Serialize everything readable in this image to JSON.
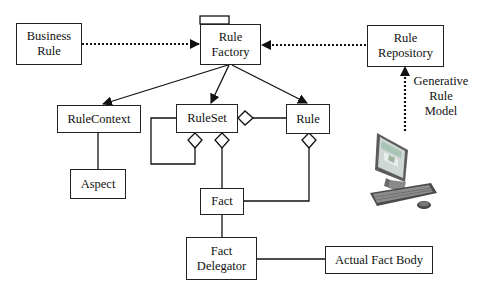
{
  "diagram": {
    "type": "uml-class-diagram",
    "nodes": {
      "business_rule": {
        "label": "Business\nRule"
      },
      "rule_factory": {
        "label": "Rule\nFactory"
      },
      "rule_repository": {
        "label": "Rule\nRepository"
      },
      "rule_context": {
        "label": "RuleContext"
      },
      "aspect": {
        "label": "Aspect"
      },
      "rule_set": {
        "label": "RuleSet"
      },
      "rule": {
        "label": "Rule"
      },
      "fact": {
        "label": "Fact"
      },
      "fact_delegator": {
        "label": "Fact\nDelegator"
      },
      "actual_fact_body": {
        "label": "Actual Fact Body"
      }
    },
    "annotations": {
      "generative_rule_model": "Generative\nRule\nModel"
    },
    "images": {
      "computer": {
        "icon": "desktop-computer-icon"
      }
    },
    "edges": [
      {
        "from": "Business Rule",
        "to": "Rule Factory",
        "style": "dotted",
        "arrow": "filled"
      },
      {
        "from": "Rule Repository",
        "to": "Rule Factory",
        "style": "dotted",
        "arrow": "filled"
      },
      {
        "from": "Computer",
        "to": "Rule Repository",
        "style": "dotted",
        "arrow": "filled",
        "label": "Generative Rule Model"
      },
      {
        "from": "Rule Factory",
        "to": "RuleContext",
        "style": "solid",
        "arrow": "filled"
      },
      {
        "from": "Rule Factory",
        "to": "RuleSet",
        "style": "solid",
        "arrow": "filled"
      },
      {
        "from": "Rule Factory",
        "to": "Rule",
        "style": "solid",
        "arrow": "filled"
      },
      {
        "from": "RuleContext",
        "to": "Aspect",
        "style": "solid",
        "arrow": "none"
      },
      {
        "from": "RuleSet",
        "to": "RuleSet",
        "style": "solid",
        "arrow": "aggregation"
      },
      {
        "from": "RuleSet",
        "to": "Fact",
        "style": "solid",
        "arrow": "aggregation"
      },
      {
        "from": "RuleSet",
        "to": "Rule",
        "style": "solid",
        "arrow": "aggregation"
      },
      {
        "from": "Rule",
        "to": "Fact",
        "style": "solid",
        "arrow": "aggregation"
      },
      {
        "from": "Fact",
        "to": "Fact Delegator",
        "style": "solid",
        "arrow": "none"
      },
      {
        "from": "Fact Delegator",
        "to": "Actual Fact Body",
        "style": "solid",
        "arrow": "none"
      }
    ],
    "colors": {
      "line": "#222222",
      "background": "#ffffff",
      "text": "#111111"
    }
  }
}
